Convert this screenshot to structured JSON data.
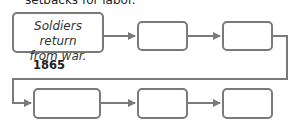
{
  "header": {
    "partial_text": "setbacks for labor."
  },
  "flowchart": {
    "boxes": [
      {
        "text_line1": "Soldiers return",
        "text_line2": "from war."
      },
      {
        "text": ""
      },
      {
        "text": ""
      },
      {
        "text": ""
      },
      {
        "text": ""
      },
      {
        "text": ""
      }
    ],
    "first_event_year": "1865"
  },
  "colors": {
    "stroke": "#7a7a7a",
    "text": "#333333"
  }
}
